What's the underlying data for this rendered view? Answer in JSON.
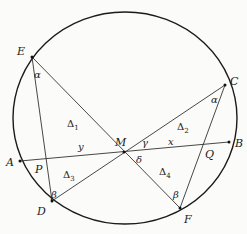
{
  "figure": {
    "circle": {
      "cx": 125,
      "cy": 118,
      "rx": 112,
      "ry": 106,
      "stroke": "#1a1a1a"
    },
    "points": [
      {
        "id": "E",
        "x": 32,
        "y": 57,
        "label": "E",
        "lx": 17,
        "ly": 55
      },
      {
        "id": "C",
        "x": 225,
        "y": 85,
        "label": "C",
        "lx": 230,
        "ly": 85
      },
      {
        "id": "A",
        "x": 20,
        "y": 161,
        "label": "A",
        "lx": 6,
        "ly": 166
      },
      {
        "id": "B",
        "x": 229,
        "y": 142,
        "label": "B",
        "lx": 235,
        "ly": 147
      },
      {
        "id": "D",
        "x": 52,
        "y": 201,
        "label": "D",
        "lx": 37,
        "ly": 215
      },
      {
        "id": "F",
        "x": 180,
        "y": 208,
        "label": "F",
        "lx": 184,
        "ly": 223
      },
      {
        "id": "M",
        "x": 124,
        "y": 152,
        "label": "M",
        "lx": 115,
        "ly": 146
      },
      {
        "id": "P",
        "x": 47,
        "y": 159,
        "label": "P",
        "lx": 35,
        "ly": 173
      },
      {
        "id": "Q",
        "x": 204,
        "y": 144,
        "label": "Q",
        "lx": 205,
        "ly": 158
      }
    ],
    "segments": [
      {
        "from": "A",
        "to": "B"
      },
      {
        "from": "E",
        "to": "F"
      },
      {
        "from": "C",
        "to": "D"
      },
      {
        "from": "E",
        "to": "D"
      },
      {
        "from": "C",
        "to": "F"
      }
    ],
    "angle_labels": [
      {
        "text": "α",
        "x": 34,
        "y": 78
      },
      {
        "text": "α",
        "x": 211,
        "y": 103
      },
      {
        "text": "β",
        "x": 51,
        "y": 198
      },
      {
        "text": "β",
        "x": 173,
        "y": 198
      },
      {
        "text": "γ",
        "x": 142,
        "y": 146
      },
      {
        "text": "δ",
        "x": 136,
        "y": 163
      }
    ],
    "segment_labels": [
      {
        "text": "x",
        "x": 168,
        "y": 145
      },
      {
        "text": "y",
        "x": 78,
        "y": 150
      }
    ],
    "region_labels": [
      {
        "text": "Δ",
        "sub": "1",
        "x": 67,
        "y": 127
      },
      {
        "text": "Δ",
        "sub": "2",
        "x": 177,
        "y": 130
      },
      {
        "text": "Δ",
        "sub": "3",
        "x": 63,
        "y": 178
      },
      {
        "text": "Δ",
        "sub": "4",
        "x": 159,
        "y": 175
      }
    ]
  }
}
